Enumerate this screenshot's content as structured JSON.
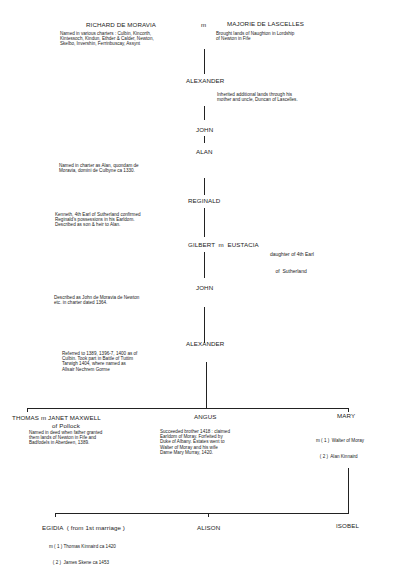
{
  "gen1": {
    "husband": {
      "name": "RICHARD DE MORAVIA",
      "note": [
        "Named in various charters : Culbin, Kincorth,",
        "Kintessoch, Kindun, Ethder & Calder, Newton,",
        "Skelbo, Invershin, Ferrinbuscay, Assynt"
      ]
    },
    "marriage": "m",
    "wife": {
      "name": "MAJORIE DE LASCELLES",
      "note": [
        "Brought lands of Naughton in Lordship",
        "of Newton in Fife"
      ]
    }
  },
  "gen2": {
    "name": "ALEXANDER",
    "note": [
      "Inherited additional lands through his",
      "mother and uncle, Duncan of Lascelles."
    ]
  },
  "gen3": {
    "name": "JOHN"
  },
  "gen4": {
    "name": "ALAN",
    "note": [
      "Named in charter as Alan, quondam de",
      "Moravia, domini de Culbyne ca 1330."
    ]
  },
  "gen5": {
    "name": "REGINALD",
    "note": [
      "Kenneth, 4th Earl of Sutherland confirmed",
      "Reginald's possessions in his Earldom.",
      "Described as son & heir to Alan."
    ]
  },
  "gen6": {
    "name": "GILBERT  m  EUSTACIA",
    "note": [
      "daughter of 4th Earl",
      "    of  Sutherland"
    ]
  },
  "gen7": {
    "name": "JOHN",
    "note": [
      "Described as John de Moravia de Newton",
      "etc. in charter dated 1364."
    ]
  },
  "gen8": {
    "name": "ALEXANDER",
    "note": [
      "Referred to 1389, 1396-7, 1400 as of",
      "Culbin.  Took part in Battle of Tuttim",
      "Tarwigh 1404, where named as",
      "Allsair Nechrem Gorme"
    ]
  },
  "gen9": [
    {
      "name": "THOMAS m JANET MAXWELL",
      "subname": "of Pollock",
      "note": [
        "Named in deed when father granted",
        "them lands of Newton in Fife and",
        "Badfodels in Aberdeen, 1389."
      ]
    },
    {
      "name": "ANGUS",
      "note": [
        "Succeeded brother 1418 : claimed",
        "Earldom of Moray.  Forfeited by",
        "Duke of Albany.  Estates went to",
        "Walter of Moray and his wife",
        "Dame Mary Murray, 1420."
      ]
    },
    {
      "name": "MARY",
      "note": [
        "m ( 1 )  Walter of Moray",
        "   ( 2 )  Alan Kinnaird"
      ]
    }
  ],
  "gen10": [
    {
      "name": "EGIDIA  ( from 1st marriage )",
      "note": [
        "m ( 1 ) Thomas Kinnaird ca 1420",
        "   ( 2 )  James Skene ca 1453"
      ]
    },
    {
      "name": "ALISON"
    },
    {
      "name": "ISOBEL"
    }
  ]
}
